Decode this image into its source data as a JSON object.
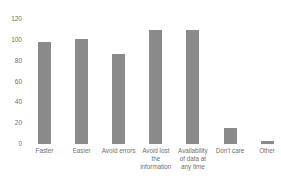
{
  "chart_data": {
    "type": "bar",
    "title": "",
    "xlabel": "",
    "ylabel": "",
    "categories": [
      "Faster",
      "Easier",
      "Avoid errors",
      "Avoid lost\nthe\ninformation",
      "Availability\nof data at\nany time",
      "Don't care",
      "Other"
    ],
    "values": [
      98,
      101,
      87,
      110,
      110,
      15,
      3
    ],
    "ylim": [
      0,
      120
    ],
    "yticks": [
      0,
      20,
      40,
      60,
      80,
      100,
      120
    ],
    "grid": false,
    "legend": "none",
    "bar_color": "#8a8a8a",
    "text_color": "#6f6f6f",
    "background": "#ffffff"
  }
}
